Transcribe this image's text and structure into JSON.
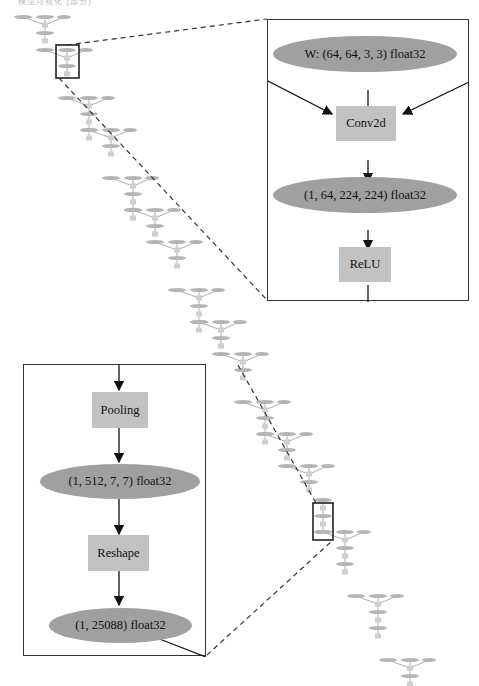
{
  "top_caption_fragment": "模型可视化 (部分)",
  "colors": {
    "ellipse_fill": "#a0a0a0",
    "box_fill": "#c2c2c2",
    "edge": "#222222",
    "inset_border": "#333333",
    "small_node_fill": "#b5b5b5"
  },
  "inset_top": {
    "nodes": {
      "weight": "W: (64, 64, 3, 3) float32",
      "conv": "Conv2d",
      "output": "(1, 64, 224, 224) float32",
      "relu": "ReLU"
    }
  },
  "inset_bottom": {
    "nodes": {
      "pooling": "Pooling",
      "pool_output": "(1, 512, 7, 7) float32",
      "reshape": "Reshape",
      "reshape_output": "(1, 25088) float32"
    }
  },
  "overview_graph": {
    "description": "VGG-style computation graph; repeated Conv2d blocks with three input ellipses (x, W, b) converging into op boxes",
    "blocks": [
      {
        "type": "conv_relu",
        "x": 45,
        "y": 17
      },
      {
        "type": "conv_relu",
        "x": 67,
        "y": 50
      },
      {
        "type": "conv_relu_pool",
        "x": 89,
        "y": 98
      },
      {
        "type": "conv_relu",
        "x": 111,
        "y": 130
      },
      {
        "type": "conv_relu_pool",
        "x": 133,
        "y": 178
      },
      {
        "type": "conv_relu",
        "x": 155,
        "y": 210
      },
      {
        "type": "conv_relu",
        "x": 177,
        "y": 242
      },
      {
        "type": "conv_relu_pool",
        "x": 199,
        "y": 290
      },
      {
        "type": "conv_relu",
        "x": 221,
        "y": 322
      },
      {
        "type": "conv_relu",
        "x": 243,
        "y": 354
      },
      {
        "type": "conv_relu_pool",
        "x": 265,
        "y": 402
      },
      {
        "type": "conv_relu",
        "x": 287,
        "y": 434
      },
      {
        "type": "conv_relu",
        "x": 309,
        "y": 466
      },
      {
        "type": "pool_reshape",
        "x": 323,
        "y": 500
      },
      {
        "type": "fc_relu_dropout",
        "x": 345,
        "y": 532
      },
      {
        "type": "fc_relu_dropout",
        "x": 378,
        "y": 596
      },
      {
        "type": "fc_softmax",
        "x": 410,
        "y": 660
      }
    ]
  }
}
